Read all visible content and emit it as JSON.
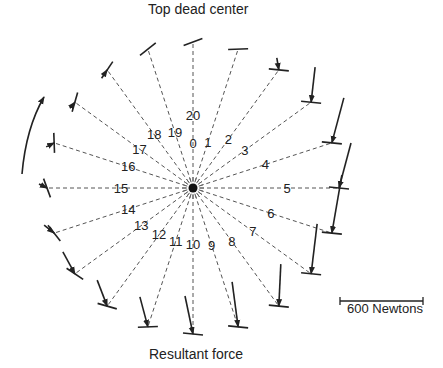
{
  "diagram": {
    "top_label": "Top dead center",
    "bottom_label": "Resultant force",
    "scale_label": "600 Newtons",
    "center": [
      193,
      188
    ],
    "positions": [
      {
        "label": "0",
        "alt_label": "20",
        "angle": 0
      },
      {
        "label": "1",
        "angle": 18
      },
      {
        "label": "2",
        "angle": 36
      },
      {
        "label": "3",
        "angle": 54
      },
      {
        "label": "4",
        "angle": 72
      },
      {
        "label": "5",
        "angle": 90
      },
      {
        "label": "6",
        "angle": 108
      },
      {
        "label": "7",
        "angle": 126
      },
      {
        "label": "8",
        "angle": 144
      },
      {
        "label": "9",
        "angle": 162
      },
      {
        "label": "10",
        "angle": 180
      },
      {
        "label": "11",
        "angle": 198
      },
      {
        "label": "12",
        "angle": 216
      },
      {
        "label": "13",
        "angle": 234
      },
      {
        "label": "14",
        "angle": 252
      },
      {
        "label": "15",
        "angle": 270
      },
      {
        "label": "16",
        "angle": 288
      },
      {
        "label": "17",
        "angle": 306
      },
      {
        "label": "18",
        "angle": 324
      },
      {
        "label": "19",
        "angle": 342
      }
    ],
    "rotation_direction": "counter-clockwise arrow on left"
  }
}
